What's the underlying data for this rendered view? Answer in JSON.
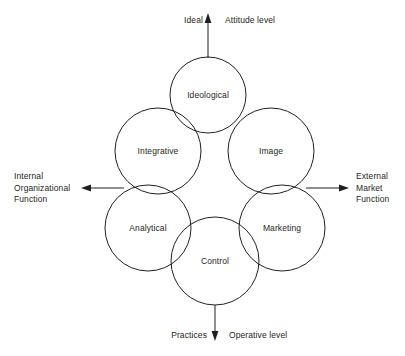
{
  "diagram": {
    "background_color": "#ffffff",
    "stroke_color": "#231f20",
    "circles": [
      {
        "id": "ideological",
        "label": "Ideological",
        "cx": 208,
        "cy": 95,
        "r": 38
      },
      {
        "id": "integrative",
        "label": "Integrative",
        "cx": 158,
        "cy": 151,
        "r": 43
      },
      {
        "id": "image",
        "label": "Image",
        "cx": 271,
        "cy": 151,
        "r": 43
      },
      {
        "id": "analytical",
        "label": "Analytical",
        "cx": 148,
        "cy": 228,
        "r": 43
      },
      {
        "id": "marketing",
        "label": "Marketing",
        "cx": 282,
        "cy": 228,
        "r": 43
      },
      {
        "id": "control",
        "label": "Control",
        "cx": 215,
        "cy": 261,
        "r": 44
      }
    ],
    "axes": {
      "top": {
        "id": "attitude-axis",
        "left_label": "Ideal",
        "right_label": "Attitude level",
        "direction": "up"
      },
      "bottom": {
        "id": "operative-axis",
        "left_label": "Practices",
        "right_label": "Operative level",
        "direction": "down"
      },
      "left": {
        "id": "internal-axis",
        "label_lines": [
          "Internal",
          "Organizational",
          "Function"
        ],
        "direction": "left"
      },
      "right": {
        "id": "external-axis",
        "label_lines": [
          "External",
          "Market",
          "Function"
        ],
        "direction": "right"
      }
    }
  }
}
